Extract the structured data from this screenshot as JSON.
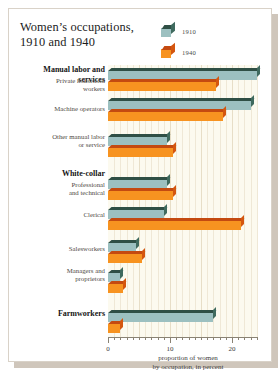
{
  "title": "Women’s occupations,\n1910 and 1940",
  "title_line1": "Women’s occupations,",
  "title_line2": "1910 and 1940",
  "legend": {
    "items": [
      {
        "label": "1910",
        "color": "#9cc0c0",
        "icon": "cube-icon"
      },
      {
        "label": "1940",
        "color": "#f79320",
        "icon": "cube-icon"
      }
    ]
  },
  "axis": {
    "tick_labels": [
      "0",
      "10",
      "20"
    ],
    "tick_values": [
      0,
      10,
      20
    ],
    "caption_line1": "proportion of women",
    "caption_line2": "by occupation, in percent"
  },
  "categories_display": [
    {
      "text": "Manual labor and\nservices",
      "type": "group"
    },
    {
      "text": "Private household\nworkers",
      "type": "item"
    },
    {
      "text": "Machine operators",
      "type": "item"
    },
    {
      "text": "Other manual labor\nor service",
      "type": "item"
    },
    {
      "text": "White-collar",
      "type": "group"
    },
    {
      "text": "Professional\nand technical",
      "type": "item"
    },
    {
      "text": "Clerical",
      "type": "item"
    },
    {
      "text": "Salesworkers",
      "type": "item"
    },
    {
      "text": "Managers and\nproprietors",
      "type": "item"
    },
    {
      "text": "Farmworkers",
      "type": "group"
    }
  ],
  "chart_data": {
    "type": "bar",
    "orientation": "horizontal",
    "title": "Women’s occupations, 1910 and 1940",
    "xlabel": "proportion of women by occupation, in percent",
    "ylabel": "",
    "xlim": [
      0,
      24.2
    ],
    "grid": true,
    "legend_position": "top-right",
    "categories": [
      "Private household workers",
      "Machine operators",
      "Other manual labor or service",
      "Professional and technical",
      "Clerical",
      "Salesworkers",
      "Managers and proprietors",
      "Farmworkers"
    ],
    "groups": [
      "Manual labor and services",
      "White-collar",
      "Farmworkers"
    ],
    "series": [
      {
        "name": "1910",
        "color": "#9cc0c0",
        "values": [
          24.0,
          23.0,
          9.5,
          9.5,
          9.0,
          4.5,
          2.0,
          17.0
        ]
      },
      {
        "name": "1940",
        "color": "#f79320",
        "values": [
          17.5,
          18.5,
          10.5,
          10.5,
          21.5,
          5.5,
          2.5,
          2.0
        ]
      }
    ]
  }
}
